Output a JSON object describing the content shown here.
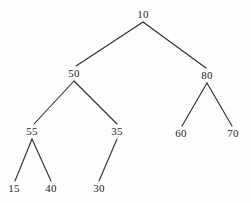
{
  "diagram": {
    "kind": "binary-tree",
    "background_color": "#fdfdfd",
    "edge_color": "#2b2b2b",
    "text_color": "#1d1d1d",
    "nodes": [
      {
        "id": "n10",
        "label": "10",
        "x": 143,
        "y": 14
      },
      {
        "id": "n50",
        "label": "50",
        "x": 74,
        "y": 73
      },
      {
        "id": "n80",
        "label": "80",
        "x": 207,
        "y": 75
      },
      {
        "id": "n55",
        "label": "55",
        "x": 32,
        "y": 131
      },
      {
        "id": "n35",
        "label": "35",
        "x": 117,
        "y": 131
      },
      {
        "id": "n60",
        "label": "60",
        "x": 181,
        "y": 133
      },
      {
        "id": "n70",
        "label": "70",
        "x": 233,
        "y": 133
      },
      {
        "id": "n15",
        "label": "15",
        "x": 14,
        "y": 188
      },
      {
        "id": "n40",
        "label": "40",
        "x": 51,
        "y": 188
      },
      {
        "id": "n30",
        "label": "30",
        "x": 99,
        "y": 188
      }
    ],
    "edges": [
      {
        "id": "e10-50",
        "from": "10",
        "to": "50",
        "x1": 143,
        "y1": 22,
        "x2": 76,
        "y2": 66
      },
      {
        "id": "e10-80",
        "from": "10",
        "to": "80",
        "x1": 143,
        "y1": 22,
        "x2": 206,
        "y2": 68
      },
      {
        "id": "e50-55",
        "from": "50",
        "to": "55",
        "x1": 74,
        "y1": 81,
        "x2": 34,
        "y2": 124
      },
      {
        "id": "e50-35",
        "from": "50",
        "to": "35",
        "x1": 74,
        "y1": 81,
        "x2": 117,
        "y2": 124
      },
      {
        "id": "e80-60",
        "from": "80",
        "to": "60",
        "x1": 207,
        "y1": 83,
        "x2": 182,
        "y2": 126
      },
      {
        "id": "e80-70",
        "from": "80",
        "to": "70",
        "x1": 207,
        "y1": 83,
        "x2": 232,
        "y2": 126
      },
      {
        "id": "e55-15",
        "from": "55",
        "to": "15",
        "x1": 32,
        "y1": 139,
        "x2": 15,
        "y2": 181
      },
      {
        "id": "e55-40",
        "from": "55",
        "to": "40",
        "x1": 32,
        "y1": 139,
        "x2": 51,
        "y2": 181
      },
      {
        "id": "e35-30",
        "from": "35",
        "to": "30",
        "x1": 117,
        "y1": 139,
        "x2": 99,
        "y2": 181
      }
    ]
  }
}
